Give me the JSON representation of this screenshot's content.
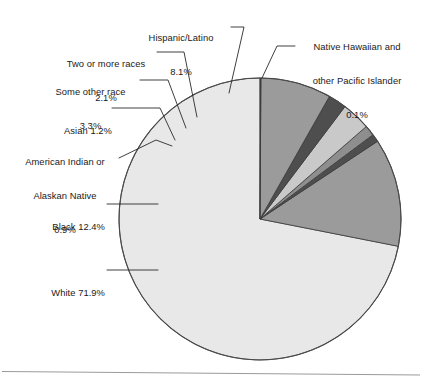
{
  "figure": {
    "type": "pie-chart-figure",
    "background": "#ffffff",
    "has_bottom_rule": true
  },
  "chart_data": {
    "type": "pie",
    "title": "",
    "subtitle": "",
    "xlabel": "",
    "ylabel": "",
    "legend_position": "none",
    "grid": false,
    "units": "percent",
    "start_angle_deg": 90,
    "direction": "counterclockwise",
    "labels": [
      "White",
      "Black",
      "American Indian or Alaskan Native",
      "Asian",
      "Some other race",
      "Two or more races",
      "Hispanic/Latino",
      "Native Hawaiian and other Pacific Islander"
    ],
    "values": [
      71.9,
      12.4,
      0.9,
      1.2,
      3.3,
      2.1,
      8.1,
      0.1
    ],
    "colors": [
      "#e8e8e8",
      "#9b9b9b",
      "#4e4e4e",
      "#8e8e8e",
      "#c9c9c9",
      "#4e4e4e",
      "#9b9b9b",
      "#3f3f3f"
    ],
    "slices": [
      {
        "name": "white",
        "label": "White",
        "value": 71.9,
        "value_text": "71.9%",
        "color": "#e8e8e8"
      },
      {
        "name": "black",
        "label": "Black",
        "value": 12.4,
        "value_text": "12.4%",
        "color": "#9b9b9b"
      },
      {
        "name": "american-indian",
        "label": "American Indian or Alaskan Native",
        "value": 0.9,
        "value_text": "0.9%",
        "color": "#4e4e4e"
      },
      {
        "name": "asian",
        "label": "Asian",
        "value": 1.2,
        "value_text": "1.2%",
        "color": "#8e8e8e"
      },
      {
        "name": "some-other-race",
        "label": "Some other race",
        "value": 3.3,
        "value_text": "3.3%",
        "color": "#c9c9c9"
      },
      {
        "name": "two-or-more",
        "label": "Two or more races",
        "value": 2.1,
        "value_text": "2.1%",
        "color": "#4e4e4e"
      },
      {
        "name": "hispanic-latino",
        "label": "Hispanic/Latino",
        "value": 8.1,
        "value_text": "8.1%",
        "color": "#9b9b9b"
      },
      {
        "name": "native-hawaiian",
        "label": "Native Hawaiian and other Pacific Islander",
        "value": 0.1,
        "value_text": "0.1%",
        "color": "#3f3f3f"
      }
    ]
  },
  "callouts": {
    "hispanic": {
      "line1": "Hispanic/Latino",
      "line2": "8.1%"
    },
    "native_hawaiian": {
      "line1": "Native Hawaiian and",
      "line2": "other Pacific Islander",
      "line3": "0.1%"
    },
    "two_or_more": {
      "line1": "Two or more races",
      "line2": "2.1%"
    },
    "some_other": {
      "line1": "Some other race",
      "line2": "3.3%"
    },
    "asian": {
      "line1": "Asian 1.2%"
    },
    "american_indian": {
      "line1": "American Indian or",
      "line2": "Alaskan Native",
      "line3": "0.9%"
    },
    "black": {
      "line1": "Black 12.4%"
    },
    "white": {
      "line1": "White 71.9%"
    }
  }
}
